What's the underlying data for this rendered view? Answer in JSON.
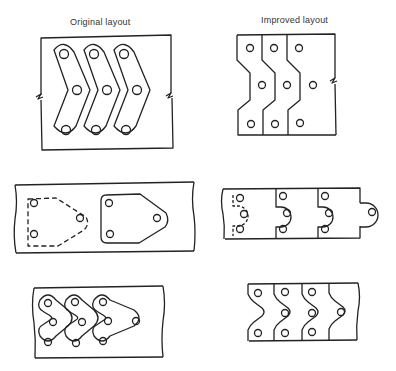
{
  "figure": {
    "left_column_title": "Original layout",
    "right_column_title": "Improved layout",
    "rows": [
      {
        "name": "curved-link",
        "original": "Three chevron-shaped curved links with three holes each, nested in strip",
        "improved": "Three zig-zag blanks sharing common cut edges, three holes each"
      },
      {
        "name": "pentagon-plate",
        "original": "Pentagonal plate with three holes, previous blank shown dashed",
        "improved": "Tabbed rectangular blanks with semicircular nose nesting into next blank"
      },
      {
        "name": "chain-link",
        "original": "Three triangular three-hole chain links nested in strip",
        "improved": "Wave-edged blanks with shared cut lines, three holes each"
      }
    ],
    "caption": ""
  },
  "colors": {
    "line": "#222222",
    "background": "#ffffff"
  }
}
